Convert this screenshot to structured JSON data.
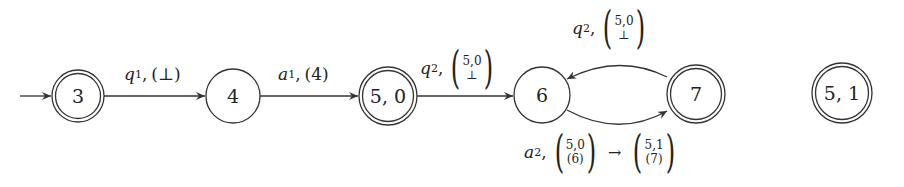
{
  "diagram": {
    "type": "automaton",
    "colors": {
      "stroke": "#333333",
      "background": "#ffffff"
    },
    "nodes": [
      {
        "id": "3",
        "label": "3",
        "accepting": true,
        "initial": true
      },
      {
        "id": "4",
        "label": "4",
        "accepting": false
      },
      {
        "id": "5,0",
        "label": "5, 0",
        "accepting": true
      },
      {
        "id": "6",
        "label": "6",
        "accepting": false
      },
      {
        "id": "7",
        "label": "7",
        "accepting": true
      },
      {
        "id": "5,1",
        "label": "5, 1",
        "accepting": true
      }
    ],
    "edges": [
      {
        "from": "3",
        "to": "4",
        "symbol": "q",
        "sub": "1",
        "comma": ",",
        "rest": "(⊥)"
      },
      {
        "from": "4",
        "to": "5,0",
        "symbol": "a",
        "sub": "1",
        "comma": ",",
        "rest": "(4)"
      },
      {
        "from": "5,0",
        "to": "6",
        "symbol": "q",
        "sub": "2",
        "comma": ",",
        "vec_top": "5,0",
        "vec_bottom": "⊥"
      },
      {
        "from": "7",
        "to": "6",
        "symbol": "q",
        "sub": "2",
        "comma": ",",
        "vec_top": "5,0",
        "vec_bottom": "⊥"
      },
      {
        "from": "6",
        "to": "7",
        "symbol": "a",
        "sub": "2",
        "comma": ",",
        "vec_top": "5,0",
        "vec_bottom": "(6)",
        "arrow": "→",
        "vec2_top": "5,1",
        "vec2_bottom": "(7)"
      }
    ]
  }
}
